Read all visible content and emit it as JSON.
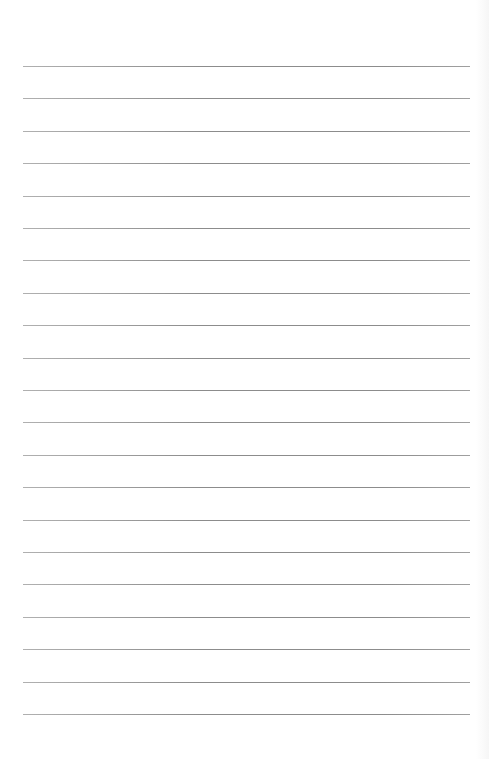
{
  "page": {
    "type": "lined-paper",
    "background": "#ffffff",
    "line_color": "#8c8c8c",
    "line_count": 21,
    "first_line_y": 66,
    "line_spacing": 32.4,
    "line_left": 23,
    "line_width": 447
  }
}
